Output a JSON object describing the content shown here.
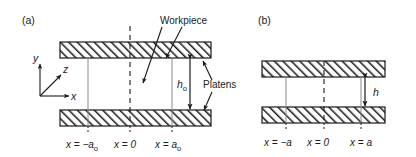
{
  "figure": {
    "panels": [
      {
        "id": "panel-a",
        "label": "(a)",
        "dimension_label": "h",
        "dimension_sub": "o",
        "coord_labels": [
          {
            "prefix": "x = −a",
            "sub": "o"
          },
          {
            "prefix": "x = 0",
            "sub": ""
          },
          {
            "prefix": "x = a",
            "sub": "o"
          }
        ]
      },
      {
        "id": "panel-b",
        "label": "(b)",
        "dimension_label": "h",
        "dimension_sub": "",
        "coord_labels": [
          {
            "prefix": "x = −a",
            "sub": ""
          },
          {
            "prefix": "x = 0",
            "sub": ""
          },
          {
            "prefix": "x = a",
            "sub": ""
          }
        ]
      }
    ],
    "annotations": {
      "workpiece": "Workpiece",
      "platens": "Platens"
    },
    "axes": {
      "y": "y",
      "z": "z",
      "x": "x"
    },
    "colors": {
      "stroke": "#1a1a1a",
      "text": "#1a1a1a",
      "background": "#ffffff",
      "hatch": "#1a1a1a"
    }
  }
}
